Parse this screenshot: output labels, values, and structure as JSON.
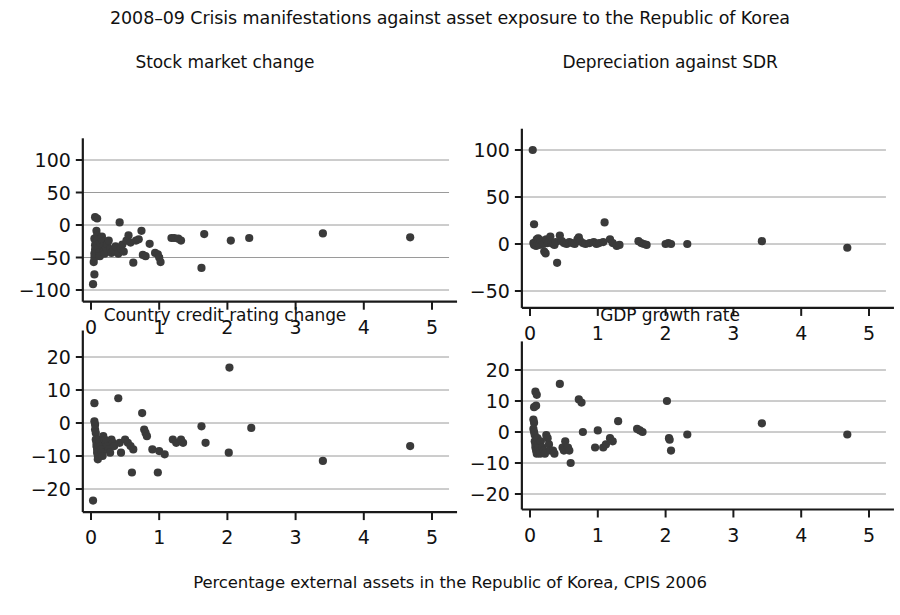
{
  "figure": {
    "title": "2008–09 Crisis manifestations against asset exposure to the Republic of Korea",
    "shared_xlabel": "Percentage external assets in the Republic of Korea, CPIS 2006",
    "marker_color": "#3a3a3a",
    "grid_color": "#9a9a9a",
    "axis_color": "#1a1a1a"
  },
  "chart_data": [
    {
      "type": "scatter",
      "panel": "top-left",
      "title": "Stock market change",
      "xlabel": "",
      "ylabel": "",
      "xlim": [
        -0.12,
        5.25
      ],
      "ylim": [
        -118,
        118
      ],
      "xticks": [
        0,
        1,
        2,
        3,
        4,
        5
      ],
      "xticklabels": [
        "0",
        "1",
        "2",
        "3",
        "4",
        "5"
      ],
      "yticks": [
        -100,
        -50,
        0,
        50,
        100
      ],
      "yticklabels": [
        "−100",
        "−50",
        "0",
        "50",
        "100"
      ],
      "grid": true,
      "legend": null,
      "points": [
        [
          0.03,
          -91
        ],
        [
          0.05,
          -76
        ],
        [
          0.04,
          -57
        ],
        [
          0.05,
          -50
        ],
        [
          0.05,
          -44
        ],
        [
          0.06,
          -38
        ],
        [
          0.06,
          -31
        ],
        [
          0.07,
          -26
        ],
        [
          0.05,
          -21
        ],
        [
          0.06,
          12
        ],
        [
          0.09,
          10
        ],
        [
          0.08,
          -9
        ],
        [
          0.09,
          -16
        ],
        [
          0.1,
          -23
        ],
        [
          0.1,
          -30
        ],
        [
          0.11,
          -36
        ],
        [
          0.12,
          -42
        ],
        [
          0.13,
          -48
        ],
        [
          0.14,
          -28
        ],
        [
          0.15,
          -21
        ],
        [
          0.16,
          -18
        ],
        [
          0.17,
          -25
        ],
        [
          0.18,
          -33
        ],
        [
          0.19,
          -40
        ],
        [
          0.2,
          -44
        ],
        [
          0.22,
          -35
        ],
        [
          0.24,
          -29
        ],
        [
          0.26,
          -24
        ],
        [
          0.28,
          -37
        ],
        [
          0.3,
          -43
        ],
        [
          0.33,
          -39
        ],
        [
          0.36,
          -33
        ],
        [
          0.4,
          -44
        ],
        [
          0.42,
          4
        ],
        [
          0.44,
          -36
        ],
        [
          0.46,
          -30
        ],
        [
          0.48,
          -41
        ],
        [
          0.52,
          -24
        ],
        [
          0.55,
          -16
        ],
        [
          0.58,
          -27
        ],
        [
          0.62,
          -58
        ],
        [
          0.66,
          -24
        ],
        [
          0.7,
          -22
        ],
        [
          0.74,
          -9
        ],
        [
          0.76,
          -46
        ],
        [
          0.8,
          -48
        ],
        [
          0.86,
          -29
        ],
        [
          0.94,
          -43
        ],
        [
          0.98,
          -45
        ],
        [
          1.0,
          -50
        ],
        [
          1.02,
          -57
        ],
        [
          1.18,
          -20
        ],
        [
          1.22,
          -20
        ],
        [
          1.28,
          -21
        ],
        [
          1.32,
          -24
        ],
        [
          1.62,
          -66
        ],
        [
          1.66,
          -14
        ],
        [
          2.05,
          -24
        ],
        [
          2.32,
          -20
        ],
        [
          3.4,
          -13
        ],
        [
          4.68,
          -19
        ]
      ]
    },
    {
      "type": "scatter",
      "panel": "top-right",
      "title": "Depreciation against SDR",
      "xlabel": "",
      "ylabel": "",
      "xlim": [
        -0.12,
        5.25
      ],
      "ylim": [
        -68,
        112
      ],
      "xticks": [
        0,
        1,
        2,
        3,
        4,
        5
      ],
      "xticklabels": [
        "0",
        "1",
        "2",
        "3",
        "4",
        "5"
      ],
      "yticks": [
        -50,
        0,
        50,
        100
      ],
      "yticklabels": [
        "−50",
        "0",
        "50",
        "100"
      ],
      "grid": true,
      "legend": null,
      "points": [
        [
          0.04,
          100
        ],
        [
          0.06,
          21
        ],
        [
          0.05,
          1
        ],
        [
          0.06,
          -1
        ],
        [
          0.07,
          0
        ],
        [
          0.08,
          2
        ],
        [
          0.09,
          -2
        ],
        [
          0.1,
          5
        ],
        [
          0.11,
          1
        ],
        [
          0.12,
          6
        ],
        [
          0.13,
          3
        ],
        [
          0.14,
          -1
        ],
        [
          0.16,
          4
        ],
        [
          0.18,
          2
        ],
        [
          0.2,
          0
        ],
        [
          0.21,
          -8
        ],
        [
          0.23,
          -10
        ],
        [
          0.24,
          5
        ],
        [
          0.26,
          1
        ],
        [
          0.28,
          2
        ],
        [
          0.3,
          8
        ],
        [
          0.32,
          1
        ],
        [
          0.34,
          0
        ],
        [
          0.36,
          -1
        ],
        [
          0.38,
          2
        ],
        [
          0.4,
          -20
        ],
        [
          0.44,
          9
        ],
        [
          0.47,
          3
        ],
        [
          0.5,
          1
        ],
        [
          0.54,
          0
        ],
        [
          0.58,
          2
        ],
        [
          0.62,
          1
        ],
        [
          0.66,
          0
        ],
        [
          0.7,
          5
        ],
        [
          0.72,
          7
        ],
        [
          0.74,
          3
        ],
        [
          0.78,
          1
        ],
        [
          0.82,
          0
        ],
        [
          0.88,
          1
        ],
        [
          0.94,
          2
        ],
        [
          0.98,
          0
        ],
        [
          1.02,
          1
        ],
        [
          1.08,
          2
        ],
        [
          1.1,
          23
        ],
        [
          1.18,
          5
        ],
        [
          1.22,
          1
        ],
        [
          1.28,
          -2
        ],
        [
          1.32,
          -1
        ],
        [
          1.6,
          3
        ],
        [
          1.64,
          1
        ],
        [
          1.68,
          0
        ],
        [
          1.72,
          -1
        ],
        [
          2.0,
          0
        ],
        [
          2.04,
          1
        ],
        [
          2.08,
          0
        ],
        [
          2.32,
          0
        ],
        [
          3.42,
          3
        ],
        [
          4.68,
          -4
        ]
      ]
    },
    {
      "type": "scatter",
      "panel": "bottom-left",
      "title": "Country credit rating change",
      "xlabel": "",
      "ylabel": "",
      "xlim": [
        -0.12,
        5.25
      ],
      "ylim": [
        -27,
        25
      ],
      "xticks": [
        0,
        1,
        2,
        3,
        4,
        5
      ],
      "xticklabels": [
        "0",
        "1",
        "2",
        "3",
        "4",
        "5"
      ],
      "yticks": [
        -20,
        -10,
        0,
        10,
        20
      ],
      "yticklabels": [
        "−20",
        "−10",
        "0",
        "10",
        "20"
      ],
      "grid": true,
      "legend": null,
      "points": [
        [
          0.03,
          -23.5
        ],
        [
          0.05,
          6
        ],
        [
          0.05,
          0.5
        ],
        [
          0.06,
          -0.5
        ],
        [
          0.06,
          -2
        ],
        [
          0.07,
          -3
        ],
        [
          0.07,
          -5
        ],
        [
          0.08,
          -6
        ],
        [
          0.08,
          -7
        ],
        [
          0.09,
          -8
        ],
        [
          0.09,
          -9
        ],
        [
          0.1,
          -10
        ],
        [
          0.1,
          -11
        ],
        [
          0.12,
          -5
        ],
        [
          0.13,
          -6
        ],
        [
          0.14,
          -7
        ],
        [
          0.15,
          -8
        ],
        [
          0.16,
          -9
        ],
        [
          0.17,
          -10
        ],
        [
          0.18,
          -4
        ],
        [
          0.2,
          -5
        ],
        [
          0.22,
          -6
        ],
        [
          0.24,
          -7
        ],
        [
          0.26,
          -8
        ],
        [
          0.28,
          -9
        ],
        [
          0.3,
          -5
        ],
        [
          0.32,
          -6
        ],
        [
          0.34,
          -7
        ],
        [
          0.4,
          7.5
        ],
        [
          0.42,
          -6
        ],
        [
          0.44,
          -9
        ],
        [
          0.5,
          -5
        ],
        [
          0.54,
          -6
        ],
        [
          0.58,
          -7
        ],
        [
          0.6,
          -15
        ],
        [
          0.62,
          -8
        ],
        [
          0.75,
          3
        ],
        [
          0.78,
          -2
        ],
        [
          0.8,
          -3
        ],
        [
          0.82,
          -4
        ],
        [
          0.9,
          -8
        ],
        [
          0.98,
          -15
        ],
        [
          1.0,
          -8.5
        ],
        [
          1.08,
          -9.5
        ],
        [
          1.2,
          -5
        ],
        [
          1.25,
          -6
        ],
        [
          1.32,
          -5
        ],
        [
          1.35,
          -6
        ],
        [
          1.62,
          -1
        ],
        [
          1.68,
          -6
        ],
        [
          2.02,
          -9
        ],
        [
          2.03,
          16.8
        ],
        [
          2.35,
          -1.5
        ],
        [
          3.4,
          -11.5
        ],
        [
          4.68,
          -7
        ]
      ]
    },
    {
      "type": "scatter",
      "panel": "bottom-right",
      "title": "GDP growth rate",
      "xlabel": "",
      "ylabel": "",
      "xlim": [
        -0.12,
        5.25
      ],
      "ylim": [
        -25,
        26
      ],
      "xticks": [
        0,
        1,
        2,
        3,
        4,
        5
      ],
      "xticklabels": [
        "0",
        "1",
        "2",
        "3",
        "4",
        "5"
      ],
      "yticks": [
        -20,
        -10,
        0,
        10,
        20
      ],
      "yticklabels": [
        "−20",
        "−10",
        "0",
        "10",
        "20"
      ],
      "grid": true,
      "legend": null,
      "points": [
        [
          0.08,
          13
        ],
        [
          0.1,
          12
        ],
        [
          0.06,
          8
        ],
        [
          0.09,
          8.5
        ],
        [
          0.05,
          4
        ],
        [
          0.06,
          3
        ],
        [
          0.05,
          1
        ],
        [
          0.06,
          0
        ],
        [
          0.07,
          -1
        ],
        [
          0.07,
          -3
        ],
        [
          0.08,
          -4
        ],
        [
          0.08,
          -5
        ],
        [
          0.09,
          -6
        ],
        [
          0.1,
          -7
        ],
        [
          0.11,
          -2
        ],
        [
          0.12,
          -4
        ],
        [
          0.13,
          -5
        ],
        [
          0.14,
          -6
        ],
        [
          0.15,
          -7
        ],
        [
          0.16,
          -3
        ],
        [
          0.18,
          -5
        ],
        [
          0.2,
          -6
        ],
        [
          0.22,
          -7
        ],
        [
          0.24,
          -1
        ],
        [
          0.26,
          -2
        ],
        [
          0.28,
          -4
        ],
        [
          0.3,
          -6
        ],
        [
          0.34,
          -6
        ],
        [
          0.36,
          -7
        ],
        [
          0.44,
          15.5
        ],
        [
          0.48,
          -5
        ],
        [
          0.5,
          -6
        ],
        [
          0.52,
          -3
        ],
        [
          0.56,
          -5
        ],
        [
          0.58,
          -6
        ],
        [
          0.6,
          -10
        ],
        [
          0.72,
          10.5
        ],
        [
          0.76,
          9.5
        ],
        [
          0.78,
          0
        ],
        [
          0.96,
          -5
        ],
        [
          1.0,
          0.5
        ],
        [
          1.08,
          -5
        ],
        [
          1.12,
          -4
        ],
        [
          1.18,
          -2
        ],
        [
          1.22,
          -3
        ],
        [
          1.3,
          3.5
        ],
        [
          1.58,
          1
        ],
        [
          1.62,
          0.5
        ],
        [
          1.66,
          0
        ],
        [
          2.02,
          10
        ],
        [
          2.05,
          -2
        ],
        [
          2.06,
          -2.5
        ],
        [
          2.08,
          -6
        ],
        [
          2.32,
          -0.8
        ],
        [
          3.42,
          2.8
        ],
        [
          4.68,
          -0.8
        ]
      ]
    }
  ]
}
